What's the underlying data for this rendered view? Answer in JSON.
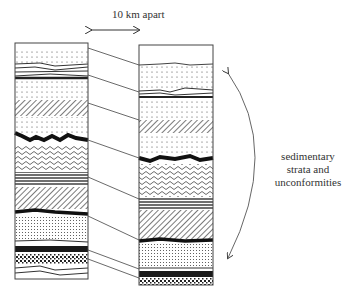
{
  "diagram": {
    "distance_label": "10 km apart",
    "side_label_lines": [
      "sedimentary",
      "strata and",
      "unconformities"
    ],
    "colors": {
      "ink": "#333333",
      "background": "#ffffff"
    },
    "columns": [
      {
        "name": "left-column",
        "layers": [
          "blank",
          "dotted",
          "wavy-lines",
          "dotted",
          "diagonal-hatch",
          "dotted",
          "black-unconformity",
          "squiggle",
          "horizontal-lines",
          "diagonal-hatch",
          "black-unconformity",
          "fine-dots",
          "thin-line",
          "solid-black",
          "coarse-dots",
          "wavy-lines"
        ]
      },
      {
        "name": "right-column",
        "layers": [
          "blank",
          "dotted",
          "wavy-lines",
          "dotted",
          "diagonal-hatch",
          "dotted",
          "black-unconformity",
          "squiggle",
          "horizontal-lines",
          "diagonal-hatch",
          "black-unconformity",
          "fine-dots",
          "thin-line",
          "solid-black",
          "coarse-dots"
        ]
      }
    ],
    "correlation_lines": 8,
    "arrows": [
      "double-headed-horizontal-distance-arrow",
      "double-headed-curved-span-arrow"
    ]
  }
}
